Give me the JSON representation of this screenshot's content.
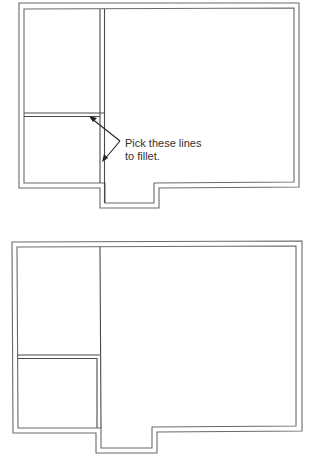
{
  "figures": [
    {
      "id": "before-fillet",
      "callout": {
        "line1": "Pick these lines",
        "line2": "to fillet."
      }
    },
    {
      "id": "after-fillet"
    }
  ],
  "colors": {
    "wall_stroke": "#6a6a6a",
    "leader_stroke": "#222222",
    "text": "#333333",
    "background": "#ffffff"
  }
}
